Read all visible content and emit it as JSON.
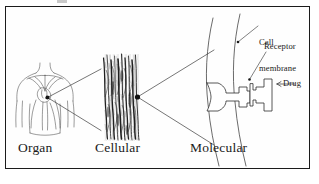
{
  "figure": {
    "kind": "scientific-diagram",
    "background_color": "#ffffff",
    "ink_color": "#1a1a1a",
    "frame_color": "#1b1b1b"
  },
  "tier_labels": {
    "organ": "Organ",
    "cellular": "Cellular",
    "molecular": "Molecular"
  },
  "callouts": {
    "cell_membrane_line1": "Cell",
    "cell_membrane_line2": "membrane",
    "receptor": "Receptor",
    "drug": "Drug"
  },
  "panels": [
    {
      "id": "organ",
      "label": "Organ",
      "depicts": "human upper torso with heart and great vessels"
    },
    {
      "id": "cellular",
      "label": "Cellular",
      "depicts": "striated muscle fiber bundle, dense vertical fibers"
    },
    {
      "id": "molecular",
      "label": "Molecular",
      "depicts": "curved cell membrane with embedded receptor and bound drug molecule"
    }
  ]
}
